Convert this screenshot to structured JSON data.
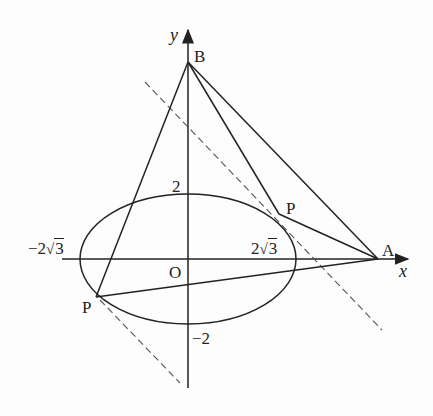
{
  "figure": {
    "axes": {
      "x_label": "x",
      "y_label": "y",
      "origin_label": "O"
    },
    "ticks": {
      "y_top": "2",
      "y_bottom": "−2",
      "x_left_prefix": "−2",
      "x_right_prefix": "2",
      "sqrt_arg": "3"
    },
    "points": {
      "A": "A",
      "B": "B",
      "P_upper": "P",
      "P_lower": "P"
    },
    "colors": {
      "stroke": "#222222",
      "dashed": "#555555",
      "background": "#fdfdfd"
    }
  },
  "geometry": {
    "ellipse": {
      "cx": 188,
      "cy": 259,
      "rx": 108,
      "ry": 65,
      "equation_semi_axes": [
        "2√3",
        "2"
      ]
    },
    "A": [
      378,
      259
    ],
    "B": [
      188,
      62
    ],
    "P_upper": [
      279,
      214
    ],
    "P_lower": [
      96,
      297
    ],
    "tangent_dashed_1": [
      [
        145,
        82
      ],
      [
        382,
        330
      ]
    ],
    "tangent_dashed_2": [
      [
        100,
        300
      ],
      [
        180,
        383
      ]
    ]
  }
}
